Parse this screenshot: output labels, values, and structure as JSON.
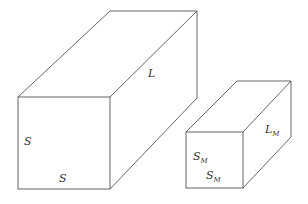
{
  "diagram": {
    "large_box": {
      "labels": {
        "length": "L",
        "side_vertical": "S",
        "side_horizontal": "S"
      }
    },
    "small_box": {
      "labels": {
        "length_base": "L",
        "length_sub": "M",
        "side_vertical_base": "S",
        "side_vertical_sub": "M",
        "side_horizontal_base": "S",
        "side_horizontal_sub": "M"
      }
    },
    "colors": {
      "edge": "#555555",
      "text": "#333333",
      "background": "#ffffff"
    }
  }
}
